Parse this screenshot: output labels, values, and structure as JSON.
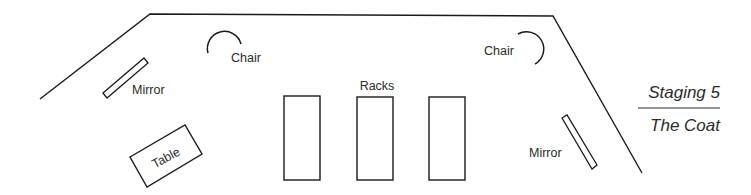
{
  "diagram": {
    "title": "Staging 5",
    "subtitle": "The Coat",
    "labels": {
      "mirror_left": "Mirror",
      "chair_left": "Chair",
      "table": "Table",
      "racks": "Racks",
      "chair_right": "Chair",
      "mirror_right": "Mirror"
    },
    "colors": {
      "line": "#1a1a1a",
      "text": "#2a2a2a",
      "background": "#ffffff"
    },
    "items": [
      {
        "type": "stage-outline"
      },
      {
        "type": "mirror",
        "label": "Mirror",
        "position": "left"
      },
      {
        "type": "chair",
        "label": "Chair",
        "position": "upper-left"
      },
      {
        "type": "table",
        "label": "Table",
        "position": "lower-left"
      },
      {
        "type": "racks",
        "label": "Racks",
        "count": 3,
        "position": "center"
      },
      {
        "type": "chair",
        "label": "Chair",
        "position": "upper-right"
      },
      {
        "type": "mirror",
        "label": "Mirror",
        "position": "right"
      }
    ]
  }
}
